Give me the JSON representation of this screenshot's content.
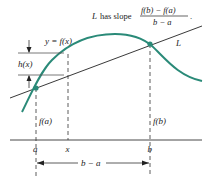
{
  "diagram": {
    "slope_label": {
      "prefix": "L",
      "text": "has slope",
      "numerator": "f(b) − f(a)",
      "denominator": "b − a",
      "suffix": "."
    },
    "curve_label": "y = f(x)",
    "line_label": "L",
    "height_label": "h(x)",
    "fa_label": "f(a)",
    "fb_label": "f(b)",
    "axis_ticks": [
      "a",
      "x",
      "b"
    ],
    "interval_label": "b − a",
    "colors": {
      "curve": "#2a8a78",
      "line": "#222222",
      "points": "#2a8a78"
    }
  }
}
